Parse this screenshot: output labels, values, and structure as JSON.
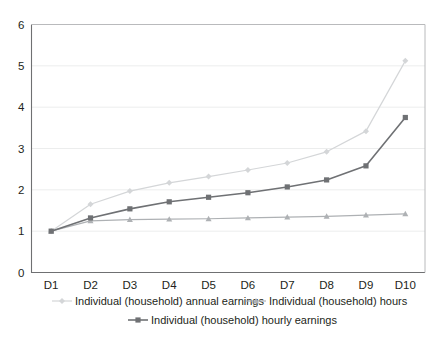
{
  "chart_data": {
    "type": "line",
    "title": "",
    "xlabel": "",
    "ylabel": "",
    "categories": [
      "D1",
      "D2",
      "D3",
      "D4",
      "D5",
      "D6",
      "D7",
      "D8",
      "D9",
      "D10"
    ],
    "ylim": [
      0,
      6
    ],
    "yticks": [
      0,
      1,
      2,
      3,
      4,
      5,
      6
    ],
    "grid": true,
    "legend_position": "bottom",
    "series": [
      {
        "name": "Individual (household) annual earnings",
        "color": "#d4d6d8",
        "marker": "diamond",
        "values": [
          1.0,
          1.65,
          1.97,
          2.17,
          2.32,
          2.48,
          2.65,
          2.92,
          3.42,
          5.12
        ]
      },
      {
        "name": "Individual (household) hours",
        "color": "#aeb1b4",
        "marker": "triangle",
        "values": [
          1.0,
          1.25,
          1.28,
          1.29,
          1.3,
          1.32,
          1.34,
          1.36,
          1.39,
          1.42
        ]
      },
      {
        "name": "Individual (household) hourly earnings",
        "color": "#6f7174",
        "marker": "square",
        "values": [
          1.0,
          1.32,
          1.54,
          1.71,
          1.82,
          1.93,
          2.07,
          2.24,
          2.58,
          3.75
        ]
      }
    ]
  },
  "axis": {
    "y_labels": [
      "6",
      "5",
      "4",
      "3",
      "2",
      "1",
      "0"
    ],
    "x_labels": [
      "D1",
      "D2",
      "D3",
      "D4",
      "D5",
      "D6",
      "D7",
      "D8",
      "D9",
      "D10"
    ]
  },
  "legend": {
    "items": [
      {
        "label": "Individual (household) annual earnings",
        "color": "#d4d6d8",
        "marker": "diamond"
      },
      {
        "label": "Individual (household) hours",
        "color": "#aeb1b4",
        "marker": "triangle"
      },
      {
        "label": "Individual (household) hourly earnings",
        "color": "#6f7174",
        "marker": "square"
      }
    ]
  }
}
